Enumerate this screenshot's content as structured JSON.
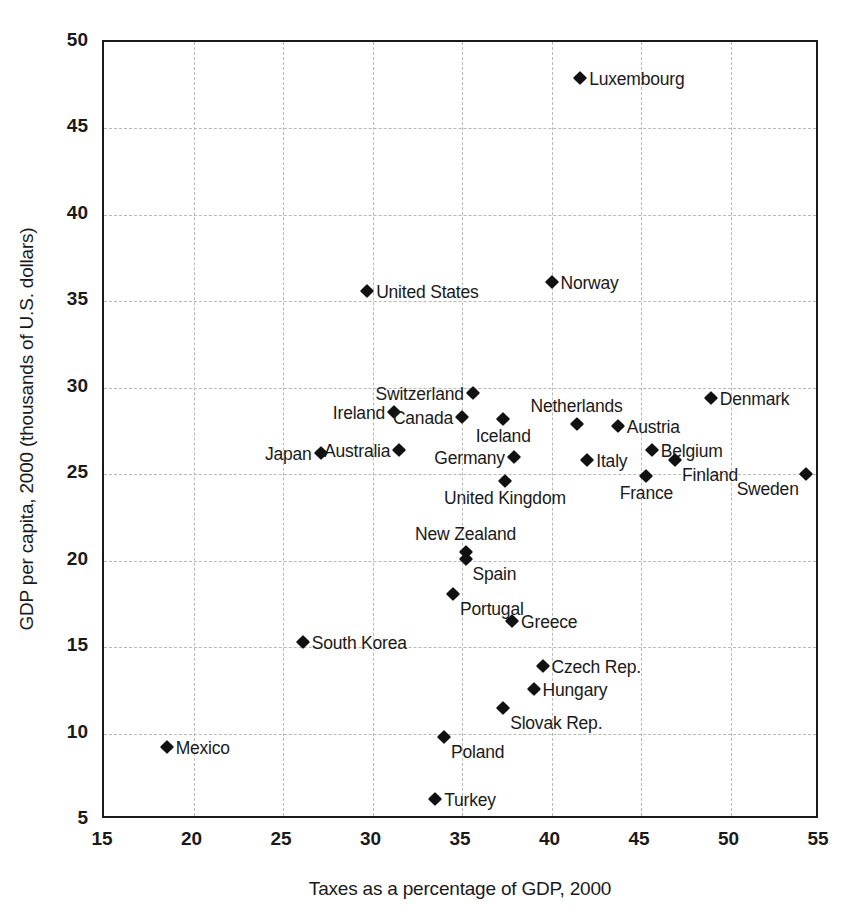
{
  "chart_data": {
    "type": "scatter",
    "title": "",
    "xlabel": "Taxes as a percentage of GDP, 2000",
    "ylabel": "GDP per capita, 2000 (thousands of U.S. dollars)",
    "xlim": [
      15,
      55
    ],
    "ylim": [
      5,
      50
    ],
    "xticks": [
      "15",
      "20",
      "25",
      "30",
      "35",
      "40",
      "45",
      "50",
      "55"
    ],
    "yticks": [
      "50",
      "45",
      "40",
      "35",
      "30",
      "25",
      "20",
      "15",
      "10",
      "5"
    ],
    "xtick_values": [
      15,
      20,
      25,
      30,
      35,
      40,
      45,
      50,
      55
    ],
    "ytick_values": [
      50,
      45,
      40,
      35,
      30,
      25,
      20,
      15,
      10,
      5
    ],
    "grid": true,
    "legend": "none",
    "marker": "filled-diamond",
    "marker_color": "#111111",
    "grid_color": "#b9b9b9",
    "frame_color": "#1a1a1a",
    "points": [
      {
        "name": "Luxembourg",
        "x": 41.6,
        "y": 47.9,
        "label_pos": "lab-right"
      },
      {
        "name": "Norway",
        "x": 40.0,
        "y": 36.1,
        "label_pos": "lab-right"
      },
      {
        "name": "United States",
        "x": 29.7,
        "y": 35.6,
        "label_pos": "lab-right"
      },
      {
        "name": "Denmark",
        "x": 48.9,
        "y": 29.4,
        "label_pos": "lab-right"
      },
      {
        "name": "Switzerland",
        "x": 35.6,
        "y": 29.7,
        "label_pos": "lab-left"
      },
      {
        "name": "Ireland",
        "x": 31.2,
        "y": 28.6,
        "label_pos": "lab-left"
      },
      {
        "name": "Canada",
        "x": 35.0,
        "y": 28.3,
        "label_pos": "lab-left"
      },
      {
        "name": "Iceland",
        "x": 37.3,
        "y": 28.2,
        "label_pos": "lab-below"
      },
      {
        "name": "Netherlands",
        "x": 41.4,
        "y": 27.9,
        "label_pos": "lab-above"
      },
      {
        "name": "Austria",
        "x": 43.7,
        "y": 27.8,
        "label_pos": "lab-right"
      },
      {
        "name": "Australia",
        "x": 31.5,
        "y": 26.4,
        "label_pos": "lab-left"
      },
      {
        "name": "Belgium",
        "x": 45.6,
        "y": 26.4,
        "label_pos": "lab-right"
      },
      {
        "name": "Japan",
        "x": 27.1,
        "y": 26.2,
        "label_pos": "lab-left"
      },
      {
        "name": "Germany",
        "x": 37.9,
        "y": 26.0,
        "label_pos": "lab-left"
      },
      {
        "name": "Finland",
        "x": 46.9,
        "y": 25.8,
        "label_pos": "lab-br"
      },
      {
        "name": "Italy",
        "x": 42.0,
        "y": 25.8,
        "label_pos": "lab-right"
      },
      {
        "name": "Sweden",
        "x": 54.2,
        "y": 25.0,
        "label_pos": "lab-bl"
      },
      {
        "name": "France",
        "x": 45.3,
        "y": 24.9,
        "label_pos": "lab-below"
      },
      {
        "name": "United Kingdom",
        "x": 37.4,
        "y": 24.6,
        "label_pos": "lab-below"
      },
      {
        "name": "New Zealand",
        "x": 35.2,
        "y": 20.5,
        "label_pos": "lab-above"
      },
      {
        "name": "Spain",
        "x": 35.2,
        "y": 20.1,
        "label_pos": "lab-br"
      },
      {
        "name": "Portugal",
        "x": 34.5,
        "y": 18.1,
        "label_pos": "lab-br"
      },
      {
        "name": "Greece",
        "x": 37.8,
        "y": 16.5,
        "label_pos": "lab-right"
      },
      {
        "name": "South Korea",
        "x": 26.1,
        "y": 15.3,
        "label_pos": "lab-right"
      },
      {
        "name": "Czech Rep.",
        "x": 39.5,
        "y": 13.9,
        "label_pos": "lab-right"
      },
      {
        "name": "Hungary",
        "x": 39.0,
        "y": 12.6,
        "label_pos": "lab-right"
      },
      {
        "name": "Slovak Rep.",
        "x": 37.3,
        "y": 11.5,
        "label_pos": "lab-br"
      },
      {
        "name": "Poland",
        "x": 34.0,
        "y": 9.8,
        "label_pos": "lab-br"
      },
      {
        "name": "Mexico",
        "x": 18.5,
        "y": 9.2,
        "label_pos": "lab-right"
      },
      {
        "name": "Turkey",
        "x": 33.5,
        "y": 6.2,
        "label_pos": "lab-right"
      }
    ]
  }
}
